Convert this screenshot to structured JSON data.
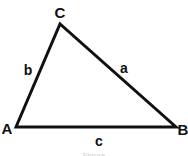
{
  "diagram": {
    "type": "triangle",
    "vertices": [
      {
        "id": "A",
        "label": "A",
        "x": 16,
        "y": 127,
        "label_x": 7,
        "label_y": 134
      },
      {
        "id": "B",
        "label": "B",
        "x": 176,
        "y": 127,
        "label_x": 183,
        "label_y": 135
      },
      {
        "id": "C",
        "label": "C",
        "x": 60,
        "y": 24,
        "label_x": 60,
        "label_y": 18
      }
    ],
    "sides": [
      {
        "id": "a",
        "label": "a",
        "from": "C",
        "to": "B",
        "label_x": 124,
        "label_y": 73
      },
      {
        "id": "b",
        "label": "b",
        "from": "A",
        "to": "C",
        "label_x": 28,
        "label_y": 75
      },
      {
        "id": "c",
        "label": "c",
        "from": "A",
        "to": "B",
        "label_x": 99,
        "label_y": 146
      }
    ],
    "stroke_color": "#111111",
    "stroke_width": 3,
    "caption": "Figure"
  }
}
